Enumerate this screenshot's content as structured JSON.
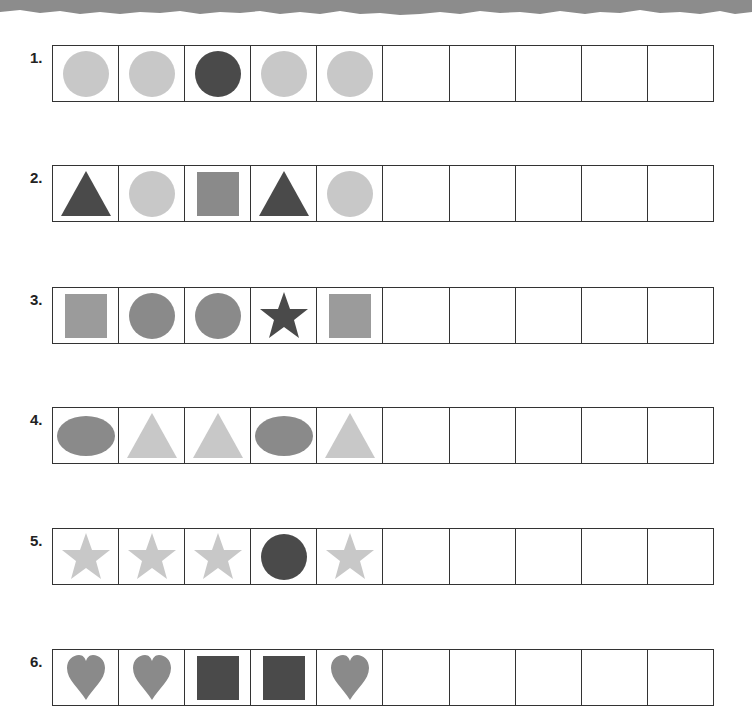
{
  "colors": {
    "light": "#c8c8c8",
    "medium": "#8a8a8a",
    "medium_light": "#9b9b9b",
    "dark": "#4a4a4a",
    "banner": "#8c8c8c",
    "border": "#333333"
  },
  "rows": [
    {
      "label": "1.",
      "cells": [
        {
          "shape": "circle",
          "tone": "light"
        },
        {
          "shape": "circle",
          "tone": "light"
        },
        {
          "shape": "circle",
          "tone": "dark"
        },
        {
          "shape": "circle",
          "tone": "light"
        },
        {
          "shape": "circle",
          "tone": "light"
        },
        {
          "shape": "empty"
        },
        {
          "shape": "empty"
        },
        {
          "shape": "empty"
        },
        {
          "shape": "empty"
        },
        {
          "shape": "empty"
        }
      ]
    },
    {
      "label": "2.",
      "cells": [
        {
          "shape": "triangle",
          "tone": "dark"
        },
        {
          "shape": "circle",
          "tone": "light"
        },
        {
          "shape": "square",
          "tone": "medium"
        },
        {
          "shape": "triangle",
          "tone": "dark"
        },
        {
          "shape": "circle",
          "tone": "light"
        },
        {
          "shape": "empty"
        },
        {
          "shape": "empty"
        },
        {
          "shape": "empty"
        },
        {
          "shape": "empty"
        },
        {
          "shape": "empty"
        }
      ]
    },
    {
      "label": "3.",
      "cells": [
        {
          "shape": "square",
          "tone": "medium_light"
        },
        {
          "shape": "circle",
          "tone": "medium"
        },
        {
          "shape": "circle",
          "tone": "medium"
        },
        {
          "shape": "star",
          "tone": "dark"
        },
        {
          "shape": "square",
          "tone": "medium_light"
        },
        {
          "shape": "empty"
        },
        {
          "shape": "empty"
        },
        {
          "shape": "empty"
        },
        {
          "shape": "empty"
        },
        {
          "shape": "empty"
        }
      ]
    },
    {
      "label": "4.",
      "cells": [
        {
          "shape": "oval",
          "tone": "medium"
        },
        {
          "shape": "triangle",
          "tone": "light"
        },
        {
          "shape": "triangle",
          "tone": "light"
        },
        {
          "shape": "oval",
          "tone": "medium"
        },
        {
          "shape": "triangle",
          "tone": "light"
        },
        {
          "shape": "empty"
        },
        {
          "shape": "empty"
        },
        {
          "shape": "empty"
        },
        {
          "shape": "empty"
        },
        {
          "shape": "empty"
        }
      ]
    },
    {
      "label": "5.",
      "cells": [
        {
          "shape": "star",
          "tone": "light"
        },
        {
          "shape": "star",
          "tone": "light"
        },
        {
          "shape": "star",
          "tone": "light"
        },
        {
          "shape": "circle",
          "tone": "dark"
        },
        {
          "shape": "star",
          "tone": "light"
        },
        {
          "shape": "empty"
        },
        {
          "shape": "empty"
        },
        {
          "shape": "empty"
        },
        {
          "shape": "empty"
        },
        {
          "shape": "empty"
        }
      ]
    },
    {
      "label": "6.",
      "cells": [
        {
          "shape": "heart",
          "tone": "medium"
        },
        {
          "shape": "heart",
          "tone": "medium"
        },
        {
          "shape": "square",
          "tone": "dark"
        },
        {
          "shape": "square",
          "tone": "dark"
        },
        {
          "shape": "heart",
          "tone": "medium"
        },
        {
          "shape": "empty"
        },
        {
          "shape": "empty"
        },
        {
          "shape": "empty"
        },
        {
          "shape": "empty"
        },
        {
          "shape": "empty"
        }
      ]
    }
  ]
}
